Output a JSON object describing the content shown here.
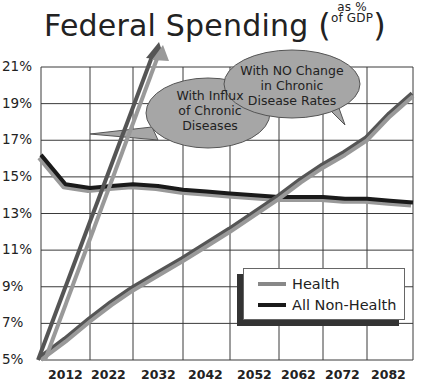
{
  "title": {
    "main": "Federal Spending",
    "sub_line1": "as %",
    "sub_line2": "of GDP"
  },
  "colors": {
    "health": "#888888",
    "health_dark": "#555555",
    "non_health": "#1a1a1a",
    "bubble_fill": "#a6a6a6",
    "grid": "#333333"
  },
  "callouts": {
    "influx": [
      "With Influx",
      "of Chronic",
      "Diseases"
    ],
    "no_change": [
      "With NO Change",
      "in Chronic",
      "Disease Rates"
    ]
  },
  "legend": {
    "items": [
      {
        "label": "Health"
      },
      {
        "label": "All Non-Health"
      }
    ]
  },
  "axis": {
    "y_ticks": [
      "21%",
      "19%",
      "17%",
      "15%",
      "13%",
      "11%",
      "9%",
      "7%",
      "5%"
    ],
    "x_ticks": [
      "2012",
      "2022",
      "2032",
      "2042",
      "2052",
      "2062",
      "2072",
      "2082"
    ]
  },
  "chart_data": {
    "type": "line",
    "xlabel": "",
    "ylabel": "",
    "x": [
      2002,
      2007,
      2012,
      2017,
      2022,
      2027,
      2032,
      2037,
      2042,
      2047,
      2052,
      2057,
      2062,
      2067,
      2072,
      2077,
      2082
    ],
    "series": [
      {
        "name": "Health",
        "values": [
          5.0,
          6.0,
          7.1,
          8.0,
          8.8,
          9.6,
          10.4,
          11.2,
          12.0,
          12.9,
          13.8,
          14.7,
          15.5,
          16.2,
          17.0,
          18.3,
          19.4
        ]
      },
      {
        "name": "All Non-Health",
        "values": [
          16.2,
          14.6,
          14.4,
          14.5,
          14.6,
          14.5,
          14.3,
          14.2,
          14.1,
          14.0,
          13.9,
          13.9,
          13.9,
          13.8,
          13.8,
          13.7,
          13.6
        ]
      },
      {
        "name": "Health (With Influx of Chronic Diseases)",
        "x": [
          2002,
          2022
        ],
        "values": [
          5.0,
          22.5
        ],
        "style": "arrow"
      }
    ],
    "annotations": [
      "With Influx of Chronic Diseases",
      "With NO Change in Chronic Disease Rates"
    ],
    "ylim": [
      5,
      21
    ],
    "xlim": [
      2002,
      2082
    ],
    "yticks": [
      5,
      7,
      9,
      11,
      13,
      15,
      17,
      19,
      21
    ],
    "xticks": [
      2012,
      2022,
      2032,
      2042,
      2052,
      2062,
      2072,
      2082
    ],
    "grid": true,
    "legend_position": "lower right"
  }
}
